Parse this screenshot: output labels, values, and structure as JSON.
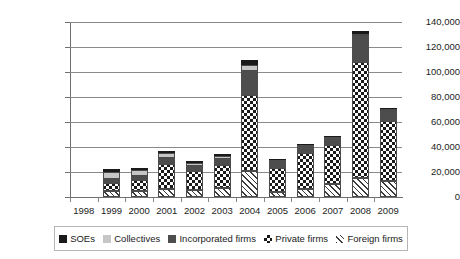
{
  "chart_data": {
    "type": "bar",
    "subtype": "stacked-vertical",
    "title": "",
    "subtitle": "",
    "xlabel": "",
    "ylabel": "",
    "categories": [
      "1998",
      "1999",
      "2000",
      "2001",
      "2002",
      "2003",
      "2004",
      "2005",
      "2006",
      "2007",
      "2008",
      "2009"
    ],
    "ylim": [
      0,
      140000
    ],
    "ytick_labels": [
      "0",
      "20,000",
      "40,000",
      "60,000",
      "80,000",
      "100,000",
      "120,000",
      "140,000"
    ],
    "ytick_values": [
      0,
      20000,
      40000,
      60000,
      80000,
      100000,
      120000,
      140000
    ],
    "grid": "horizontal",
    "legend_position": "bottom",
    "stack_order_bottom_to_top": [
      "Foreign firms",
      "Private firms",
      "Incorporated firms",
      "Collectives",
      "SOEs"
    ],
    "series": [
      {
        "name": "SOEs",
        "marker": "black-square",
        "color": "#1a1a1a",
        "values": [
          0,
          2500,
          1500,
          1500,
          1200,
          1500,
          4500,
          700,
          700,
          700,
          2500,
          700
        ]
      },
      {
        "name": "Collectives",
        "marker": "light-gray-square",
        "color": "#c6c6c6",
        "values": [
          0,
          5500,
          4500,
          4500,
          2500,
          2500,
          5000,
          0,
          0,
          0,
          1500,
          1200
        ]
      },
      {
        "name": "Incorporated firms",
        "marker": "dark-gray-square",
        "color": "#4d4d4d",
        "values": [
          0,
          3000,
          3000,
          4500,
          4000,
          4500,
          18500,
          6500,
          6000,
          7000,
          21000,
          8500
        ]
      },
      {
        "name": "Private firms",
        "marker": "checkerboard-square",
        "color": "#1a1a1a",
        "values": [
          0,
          6500,
          9000,
          20000,
          15000,
          18500,
          61000,
          19000,
          29000,
          31000,
          93000,
          48000
        ]
      },
      {
        "name": "Foreign firms",
        "marker": "diagonal-hatch-square",
        "color": "#3a3a3a",
        "values": [
          0,
          5000,
          5000,
          6500,
          6000,
          7500,
          21000,
          4000,
          6500,
          10500,
          15000,
          12500
        ]
      }
    ],
    "totals": [
      0,
      22500,
      23000,
      37000,
      28700,
      34500,
      110000,
      30200,
      42200,
      49200,
      133000,
      70900
    ]
  },
  "legend": {
    "items": [
      {
        "label": "SOEs",
        "icon": "black-square-icon"
      },
      {
        "label": "Collectives",
        "icon": "light-gray-square-icon"
      },
      {
        "label": "Incorporated firms",
        "icon": "dark-gray-square-icon"
      },
      {
        "label": "Private firms",
        "icon": "checkerboard-square-icon"
      },
      {
        "label": "Foreign firms",
        "icon": "diagonal-hatch-square-icon"
      }
    ]
  }
}
